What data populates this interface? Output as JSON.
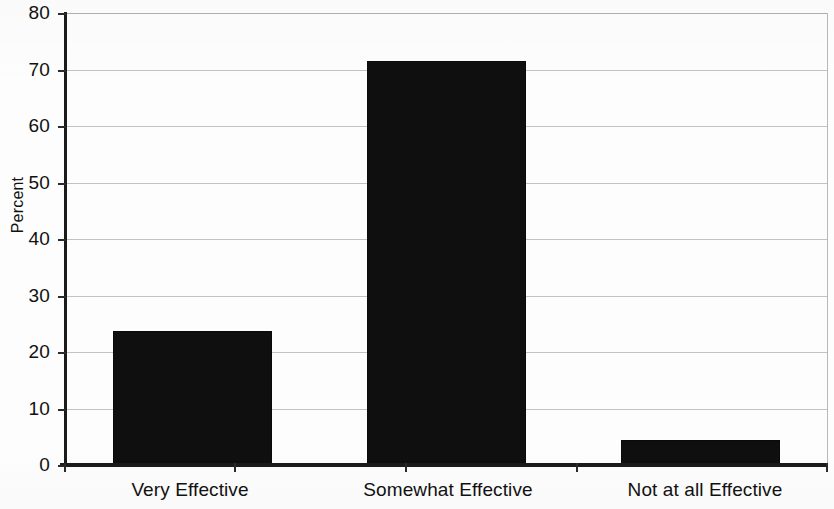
{
  "chart_data": {
    "type": "bar",
    "title": "",
    "subtitle": "",
    "xlabel": "",
    "ylabel": "Percent",
    "categories": [
      "Very Effective",
      "Somewhat Effective",
      "Not at all Effective"
    ],
    "values": [
      23.7,
      71.5,
      4.4
    ],
    "series": [
      {
        "name": "Percent",
        "values": [
          23.7,
          71.5,
          4.4
        ]
      }
    ],
    "ylim": [
      0,
      80
    ],
    "xlim": [
      0,
      3
    ],
    "y_ticks": [
      0,
      10,
      20,
      30,
      40,
      50,
      60,
      70,
      80
    ],
    "y_tick_labels": [
      "0",
      "10",
      "20",
      "30",
      "40",
      "50",
      "60",
      "70",
      "80"
    ],
    "x_tick_labels": [
      "Very Effective",
      "Somewhat Effective",
      "Not at all Effective"
    ],
    "grid": true,
    "grid_axis": "y",
    "legend": false,
    "legend_position": "none",
    "bar_color": "#100f0f",
    "grid_color": "#c2c2c2",
    "axis_color": "#1b1b1b",
    "background_color": "#ffffff",
    "annotations": []
  },
  "axes": {
    "y_axis_title": "Percent"
  }
}
